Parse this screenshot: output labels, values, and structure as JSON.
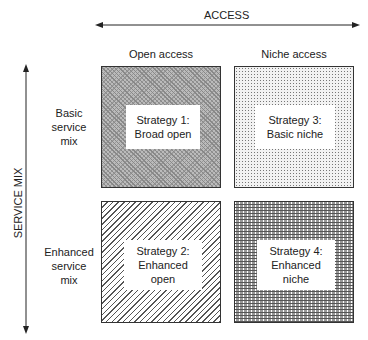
{
  "axes": {
    "horizontal": {
      "title": "ACCESS",
      "columns": [
        "Open access",
        "Niche access"
      ]
    },
    "vertical": {
      "title": "SERVICE MIX",
      "rows": [
        "Basic\nservice\nmix",
        "Enhanced\nservice\nmix"
      ]
    }
  },
  "quadrants": [
    {
      "id": 1,
      "line1": "Strategy 1:",
      "line2": "Broad open",
      "line3": "",
      "pattern": "dense-crosshatch"
    },
    {
      "id": 3,
      "line1": "Strategy 3:",
      "line2": "Basic niche",
      "line3": "",
      "pattern": "light-dots"
    },
    {
      "id": 2,
      "line1": "Strategy 2:",
      "line2": "Enhanced",
      "line3": "open",
      "pattern": "diagonal-lines"
    },
    {
      "id": 4,
      "line1": "Strategy 4:",
      "line2": "Enhanced",
      "line3": "niche",
      "pattern": "brick"
    }
  ]
}
